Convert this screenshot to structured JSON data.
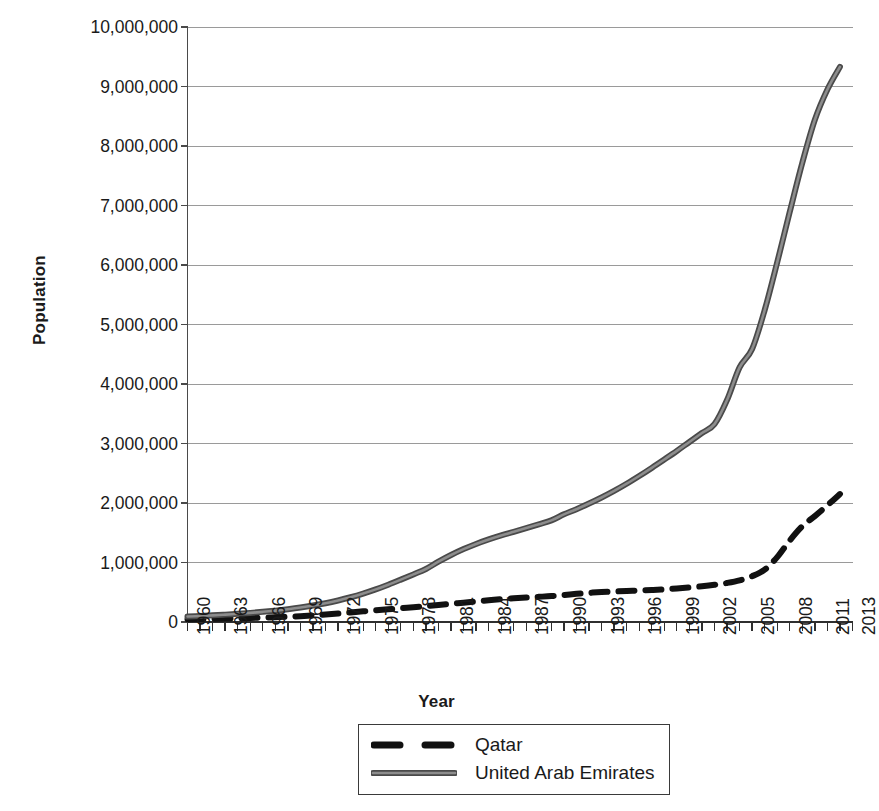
{
  "chart_data": {
    "type": "line",
    "title": "",
    "xlabel": "Year",
    "ylabel": "Population",
    "grid": true,
    "legend_position": "bottom",
    "xlim": [
      1960,
      2013
    ],
    "ylim": [
      0,
      10000000
    ],
    "y_ticks": [
      0,
      1000000,
      2000000,
      3000000,
      4000000,
      5000000,
      6000000,
      7000000,
      8000000,
      9000000,
      10000000
    ],
    "y_tick_labels": [
      "0",
      "1,000,000",
      "2,000,000",
      "3,000,000",
      "4,000,000",
      "5,000,000",
      "6,000,000",
      "7,000,000",
      "8,000,000",
      "9,000,000",
      "10,000,000"
    ],
    "x_tick_labels": [
      "1960",
      "1963",
      "1966",
      "1969",
      "1972",
      "1975",
      "1978",
      "1981",
      "1984",
      "1987",
      "1990",
      "1993",
      "1996",
      "1999",
      "2002",
      "2005",
      "2008",
      "2011",
      "2013"
    ],
    "x_tick_values": [
      1960,
      1963,
      1966,
      1969,
      1972,
      1975,
      1978,
      1981,
      1984,
      1987,
      1990,
      1993,
      1996,
      1999,
      2002,
      2005,
      2008,
      2011,
      2013
    ],
    "x_minor_tick_every": 1,
    "x": [
      1960,
      1961,
      1962,
      1963,
      1964,
      1965,
      1966,
      1967,
      1968,
      1969,
      1970,
      1971,
      1972,
      1973,
      1974,
      1975,
      1976,
      1977,
      1978,
      1979,
      1980,
      1981,
      1982,
      1983,
      1984,
      1985,
      1986,
      1987,
      1988,
      1989,
      1990,
      1991,
      1992,
      1993,
      1994,
      1995,
      1996,
      1997,
      1998,
      1999,
      2000,
      2001,
      2002,
      2003,
      2004,
      2005,
      2006,
      2007,
      2008,
      2009,
      2010,
      2011,
      2012
    ],
    "series": [
      {
        "name": "Qatar",
        "style": "dashed",
        "color": "#111111",
        "line_width": 6,
        "values": [
          47000,
          50000,
          54000,
          58000,
          63000,
          68000,
          74000,
          81000,
          89000,
          98000,
          110000,
          125000,
          142000,
          161000,
          179000,
          196000,
          213000,
          231000,
          248000,
          266000,
          285000,
          305000,
          325000,
          345000,
          365000,
          383000,
          398000,
          411000,
          423000,
          436000,
          453000,
          473000,
          490000,
          503000,
          513000,
          522000,
          530000,
          538000,
          548000,
          563000,
          580000,
          600000,
          625000,
          656000,
          700000,
          770000,
          880000,
          1090000,
          1370000,
          1610000,
          1780000,
          1960000,
          2150000
        ]
      },
      {
        "name": "United Arab Emirates",
        "style": "solid",
        "color": "#595959",
        "line_width": 6,
        "values": [
          92000,
          101000,
          112000,
          124000,
          138000,
          153000,
          171000,
          191000,
          215000,
          243000,
          276000,
          315000,
          362000,
          416000,
          478000,
          548000,
          627000,
          712000,
          800000,
          891000,
          1014000,
          1126000,
          1225000,
          1312000,
          1388000,
          1455000,
          1516000,
          1578000,
          1642000,
          1708000,
          1809000,
          1896000,
          1991000,
          2093000,
          2204000,
          2324000,
          2454000,
          2590000,
          2731000,
          2875000,
          3026000,
          3176000,
          3325000,
          3730000,
          4279000,
          4588000,
          5242000,
          6045000,
          6894000,
          7718000,
          8441000,
          8950000,
          9330000
        ]
      }
    ]
  },
  "axis": {
    "y_title": "Population",
    "x_title": "Year"
  },
  "legend": {
    "entries": [
      {
        "label": "Qatar",
        "swatch": "dashed-black-line"
      },
      {
        "label": "United Arab Emirates",
        "swatch": "solid-gray-line"
      }
    ]
  },
  "colors": {
    "qatar": "#111111",
    "uae": "#595959",
    "gridline": "#9a9a9a",
    "axis": "#4a4a4a",
    "text": "#1a1a1a",
    "background": "#ffffff"
  }
}
